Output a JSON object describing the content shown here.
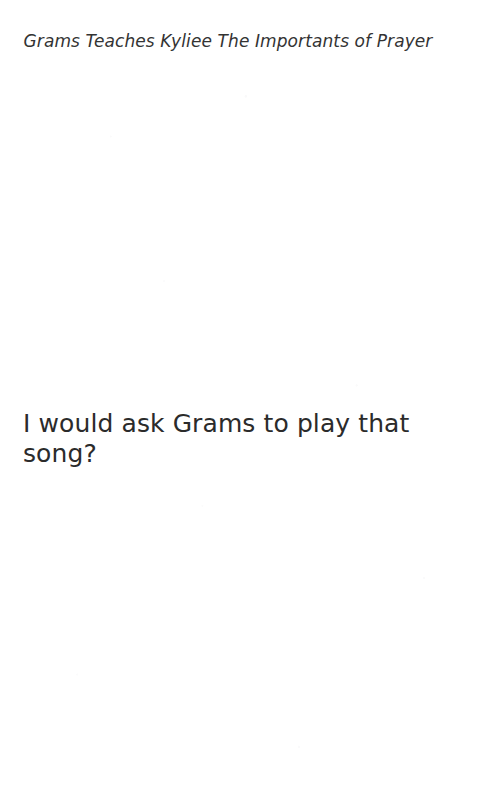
{
  "page": {
    "background_color": "#ffffff",
    "width": 482,
    "height": 803
  },
  "header": {
    "title": "Grams Teaches Kyliee The Importants of Prayer",
    "color": "#333333"
  },
  "body": {
    "paragraphs": [
      "I would ask Grams to play that song?"
    ],
    "color": "#2b2b2b"
  }
}
